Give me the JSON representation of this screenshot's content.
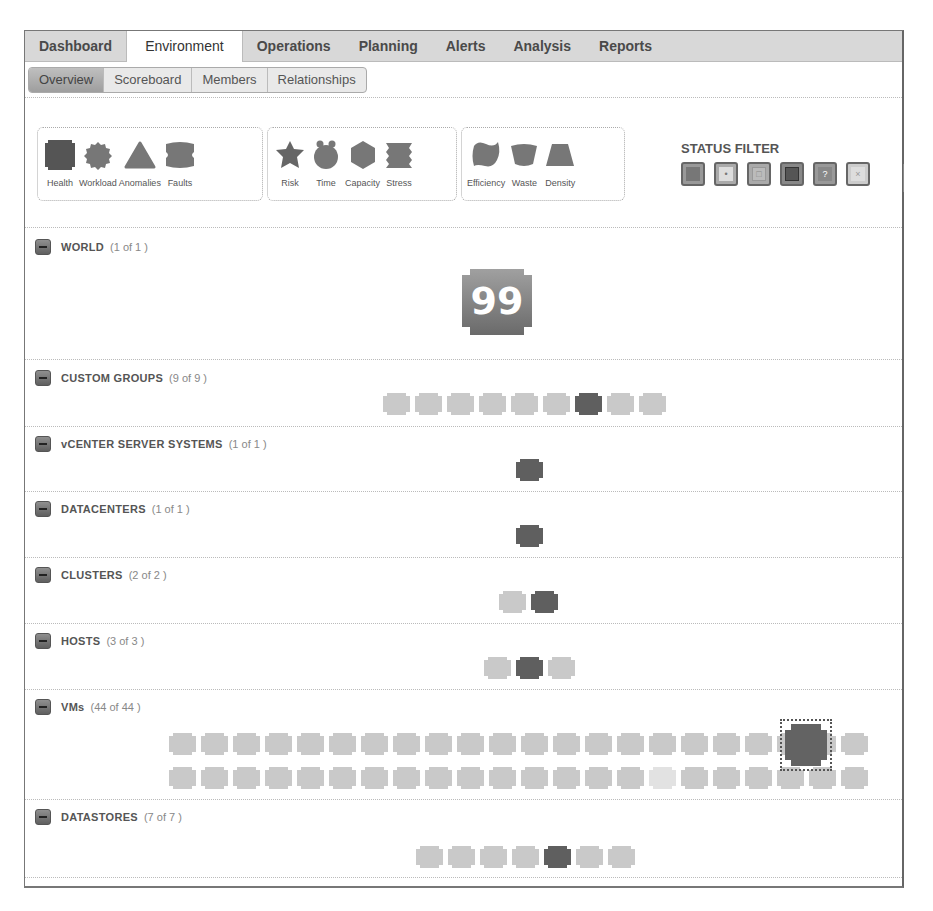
{
  "main_tabs": [
    {
      "label": "Dashboard",
      "active": false
    },
    {
      "label": "Environment",
      "active": true
    },
    {
      "label": "Operations",
      "active": false
    },
    {
      "label": "Planning",
      "active": false
    },
    {
      "label": "Alerts",
      "active": false
    },
    {
      "label": "Analysis",
      "active": false
    },
    {
      "label": "Reports",
      "active": false
    }
  ],
  "sub_tabs": [
    {
      "label": "Overview",
      "active": true
    },
    {
      "label": "Scoreboard",
      "active": false
    },
    {
      "label": "Members",
      "active": false
    },
    {
      "label": "Relationships",
      "active": false
    }
  ],
  "badge_groups": [
    {
      "badges": [
        {
          "label": "Health",
          "icon": "health-icon"
        },
        {
          "label": "Workload",
          "icon": "workload-icon"
        },
        {
          "label": "Anomalies",
          "icon": "anomalies-icon"
        },
        {
          "label": "Faults",
          "icon": "faults-icon"
        }
      ]
    },
    {
      "badges": [
        {
          "label": "Risk",
          "icon": "risk-icon"
        },
        {
          "label": "Time",
          "icon": "time-icon"
        },
        {
          "label": "Capacity",
          "icon": "capacity-icon"
        },
        {
          "label": "Stress",
          "icon": "stress-icon"
        }
      ]
    },
    {
      "badges": [
        {
          "label": "Efficiency",
          "icon": "efficiency-icon"
        },
        {
          "label": "Waste",
          "icon": "waste-icon"
        },
        {
          "label": "Density",
          "icon": "density-icon"
        }
      ]
    }
  ],
  "status_filter": {
    "title": "STATUS FILTER",
    "items": [
      {
        "name": "green",
        "glyph": ""
      },
      {
        "name": "yellow",
        "glyph": "•"
      },
      {
        "name": "orange",
        "glyph": "□"
      },
      {
        "name": "red",
        "glyph": ""
      },
      {
        "name": "unknown",
        "glyph": "?"
      },
      {
        "name": "offline",
        "glyph": "×"
      }
    ]
  },
  "colors": {
    "health_dark": "#636363",
    "tile_light": "#cfcfcf",
    "tile_medium": "#bdbdbd",
    "world_badge": "#8a8a8a"
  },
  "sections": [
    {
      "title": "WORLD",
      "count": "(1 of 1 )",
      "world_score": "99"
    },
    {
      "title": "CUSTOM GROUPS",
      "count": "(9 of 9 )",
      "tiles": [
        "l",
        "l",
        "l",
        "l",
        "l",
        "l",
        "d",
        "l",
        "l"
      ]
    },
    {
      "title": "vCENTER SERVER SYSTEMS",
      "count": "(1 of 1 )",
      "tiles": [
        "d"
      ]
    },
    {
      "title": "DATACENTERS",
      "count": "(1 of 1 )",
      "tiles": [
        "d"
      ]
    },
    {
      "title": "CLUSTERS",
      "count": "(2 of 2 )",
      "tiles": [
        "l",
        "d"
      ]
    },
    {
      "title": "HOSTS",
      "count": "(3 of 3 )",
      "tiles": [
        "l",
        "d",
        "l"
      ]
    },
    {
      "title": "VMs",
      "count": "(44 of 44 )",
      "tiles_row1": [
        "l",
        "l",
        "l",
        "l",
        "l",
        "l",
        "l",
        "l",
        "l",
        "l",
        "l",
        "l",
        "l",
        "l",
        "l",
        "l",
        "l",
        "l",
        "l",
        "l",
        "l",
        "l"
      ],
      "tiles_row2": [
        "l",
        "l",
        "l",
        "l",
        "l",
        "l",
        "l",
        "l",
        "l",
        "l",
        "l",
        "l",
        "l",
        "l",
        "l",
        "w",
        "l",
        "l",
        "l",
        "l",
        "l",
        "l"
      ],
      "selected": "d"
    },
    {
      "title": "DATASTORES",
      "count": "(7 of 7 )",
      "tiles": [
        "l",
        "l",
        "l",
        "l",
        "d",
        "l",
        "l"
      ]
    }
  ]
}
